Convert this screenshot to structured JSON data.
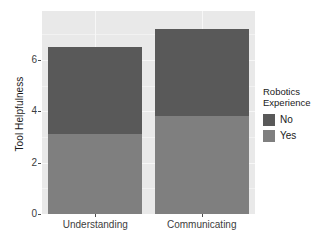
{
  "chart_data": {
    "type": "bar",
    "subtype": "stacked-bar",
    "title": "",
    "xlabel": "",
    "ylabel": "Tool Helpfulness",
    "categories": [
      "Understanding",
      "Communicating"
    ],
    "series": [
      {
        "name": "Yes",
        "values": [
          3.1,
          3.8
        ],
        "color": "#7f7f7f"
      },
      {
        "name": "No",
        "values": [
          3.4,
          3.4
        ],
        "color": "#595959"
      }
    ],
    "stack_totals": [
      6.5,
      7.2
    ],
    "ylim": [
      0,
      7.9
    ],
    "yticks": [
      0,
      2,
      4,
      6
    ],
    "ytick_labels": [
      "0",
      "2",
      "4",
      "6"
    ],
    "grid": true,
    "grid_major_values": [
      0,
      2,
      4,
      6
    ],
    "grid_minor_values": [
      1,
      3,
      5,
      7
    ],
    "legend": {
      "title": "Robotics\nExperience",
      "position": "right",
      "entries": [
        {
          "label": "No",
          "color": "#595959"
        },
        {
          "label": "Yes",
          "color": "#7f7f7f"
        }
      ]
    },
    "panel_background": "#e9e9e9",
    "plot_background": "#ffffff"
  }
}
